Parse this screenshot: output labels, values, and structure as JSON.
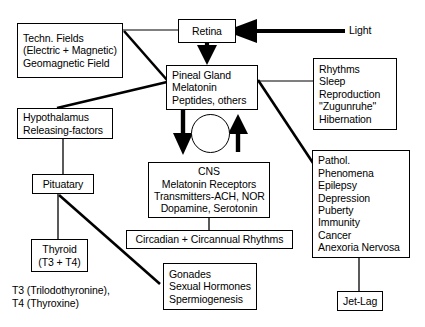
{
  "diagram": {
    "nodes": {
      "techn_fields": {
        "name": "techn-fields",
        "lines": [
          "Techn. Fields",
          "(Electric + Magnetic)",
          "Geomagnetic Field"
        ]
      },
      "retina": {
        "name": "retina",
        "lines": [
          "Retina"
        ]
      },
      "light": {
        "name": "light",
        "lines": [
          "Light"
        ]
      },
      "pineal_gland": {
        "name": "pineal-gland",
        "lines": [
          "Pineal Gland",
          "Melatonin",
          "Peptides, others"
        ]
      },
      "rhythms": {
        "name": "rhythms",
        "lines": [
          "Rhythms",
          "Sleep",
          "Reproduction",
          "\"Zugunruhe\"",
          "Hibernation"
        ]
      },
      "hypothalamus": {
        "name": "hypothalamus",
        "lines": [
          "Hypothalamus",
          "Releasing-factors"
        ]
      },
      "pituitary": {
        "name": "pituitary",
        "lines": [
          "Pituatary"
        ]
      },
      "cns": {
        "name": "cns",
        "lines": [
          "CNS",
          "Melatonin Receptors",
          "Transmitters-ACH, NOR",
          "Dopamine, Serotonin"
        ]
      },
      "pathology": {
        "name": "pathology",
        "lines": [
          "Pathol.",
          "Phenomena",
          "Epilepsy",
          "Depression",
          "Puberty",
          "Immunity",
          "Cancer",
          "Anexoria Nervosa"
        ]
      },
      "circadian": {
        "name": "circadian-rhythms",
        "lines": [
          "Circadian + Circannual Rhythms"
        ]
      },
      "thyroid": {
        "name": "thyroid",
        "lines": [
          "Thyroid",
          "(T3 + T4)"
        ]
      },
      "gonades": {
        "name": "gonades",
        "lines": [
          "Gonades",
          "Sexual Hormones",
          "Spermiogenesis"
        ]
      },
      "jet_lag": {
        "name": "jet-lag",
        "lines": [
          "Jet-Lag"
        ]
      },
      "footnote": {
        "name": "abbreviation-footnote",
        "lines": [
          "T3 (Trilodothyronine),",
          "T4 (Thyroxine)"
        ]
      }
    },
    "icons": {
      "clock": "clock-icon",
      "arrow_light_to_retina": "thick-left-arrow-icon",
      "arrow_retina_to_pineal": "thick-down-arrow-icon",
      "arrow_pineal_to_cns": "thick-down-arrow-icon",
      "arrow_cns_to_pineal": "thick-up-arrow-icon"
    },
    "colors": {
      "stroke": "#000000",
      "background": "#ffffff"
    }
  }
}
